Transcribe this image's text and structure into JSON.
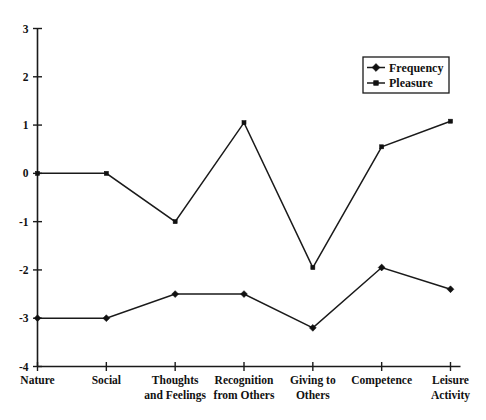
{
  "chart_data": {
    "type": "line",
    "title": "",
    "xlabel": "",
    "ylabel": "",
    "ylim": [
      -4,
      3
    ],
    "yticks": [
      3,
      2,
      1,
      0,
      -1,
      -2,
      -3,
      -4
    ],
    "ytick_labels": [
      "3",
      "2",
      "1",
      "0",
      "-1",
      "-2",
      "-3",
      "-4"
    ],
    "grid": false,
    "legend_position": "top-right",
    "categories": [
      "Nature",
      "Social",
      "Thoughts and Feelings",
      "Recognition from Others",
      "Giving to Others",
      "Competence",
      "Leisure Activity"
    ],
    "category_lines": [
      [
        "Nature"
      ],
      [
        "Social"
      ],
      [
        "Thoughts",
        "and Feelings"
      ],
      [
        "Recognition",
        "from Others"
      ],
      [
        "Giving to",
        "Others"
      ],
      [
        "Competence"
      ],
      [
        "Leisure",
        "Activity"
      ]
    ],
    "series": [
      {
        "name": "Frequency",
        "marker": "diamond",
        "values": [
          -3.0,
          -3.0,
          -2.5,
          -2.5,
          -3.2,
          -1.95,
          -2.4
        ]
      },
      {
        "name": "Pleasure",
        "marker": "square",
        "values": [
          0.0,
          0.0,
          -1.0,
          1.05,
          -1.95,
          0.55,
          1.08
        ]
      }
    ]
  },
  "legend": {
    "entries": [
      {
        "label": "Frequency",
        "marker": "diamond"
      },
      {
        "label": "Pleasure",
        "marker": "square"
      }
    ]
  },
  "colors": {
    "line": "#1a1a1a",
    "marker": "#111111",
    "background": "#ffffff",
    "text": "#111111"
  }
}
